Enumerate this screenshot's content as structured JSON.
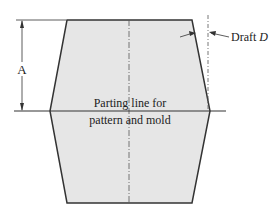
{
  "diagram": {
    "labels": {
      "dimension": "A",
      "parting_line_1": "Parting line for",
      "parting_line_2": "pattern and mold",
      "draft_prefix": "Draft ",
      "draft_symbol": "D"
    },
    "colors": {
      "fill": "#e6e6e6",
      "outline": "#333333",
      "centerline": "#555555"
    }
  }
}
